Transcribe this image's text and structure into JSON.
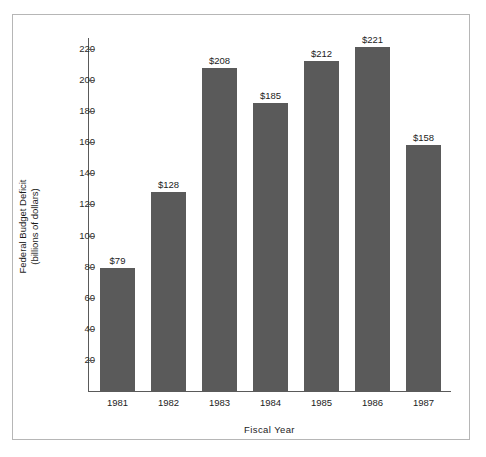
{
  "figure": {
    "background_color": "#ffffff",
    "frame_color": "#b6b6b6"
  },
  "chart_data": {
    "type": "bar",
    "title": "",
    "subtitle": "",
    "xlabel": "Fiscal Year",
    "ylabel_line1": "Federal Budget Deficit",
    "ylabel_line2": "(billions of dollars)",
    "categories": [
      "1981",
      "1982",
      "1983",
      "1984",
      "1985",
      "1986",
      "1987"
    ],
    "values": [
      79,
      128,
      208,
      185,
      212,
      221,
      158
    ],
    "data_labels": [
      "$79",
      "$128",
      "$208",
      "$185",
      "$212",
      "$221",
      "$158"
    ],
    "ylim": [
      0,
      232
    ],
    "yticks": [
      20,
      40,
      60,
      80,
      100,
      120,
      140,
      160,
      180,
      200,
      220
    ],
    "ytick_labels": [
      "20",
      "40",
      "60",
      "80",
      "100",
      "120",
      "140",
      "160",
      "180",
      "200",
      "220"
    ],
    "grid": false,
    "legend": null,
    "legend_position": "none",
    "bar_color": "#5a5a5a",
    "axis_color": "#5a5a5a",
    "text_color": "#1c1c1c"
  }
}
